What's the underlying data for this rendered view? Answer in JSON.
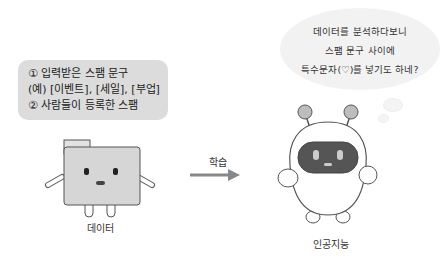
{
  "input_box": {
    "lines": [
      "① 입력받은 스팸 문구",
      "(예) [이벤트], [세일], [부업]",
      "② 사람들이 등록한 스팸"
    ]
  },
  "speech_bubble": {
    "lines": [
      "데이터를 분석하다보니",
      "스팸 문구 사이에",
      "특수문자(♡)를 넣기도 하네?"
    ]
  },
  "arrow": {
    "label": "학습"
  },
  "data_character": {
    "label": "데이터"
  },
  "ai_character": {
    "label": "인공지능"
  }
}
